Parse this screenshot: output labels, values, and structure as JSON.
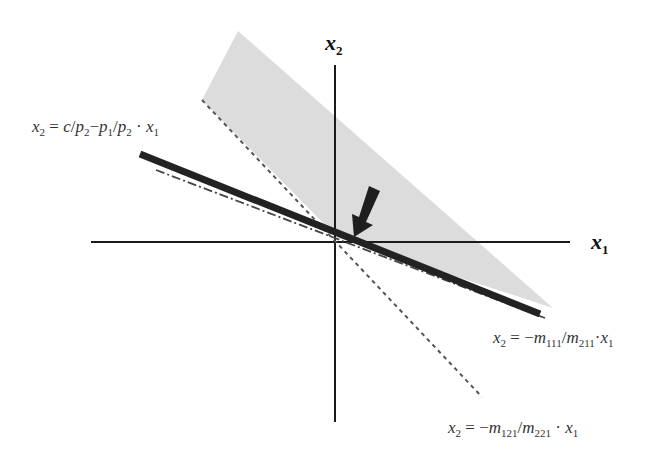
{
  "diagram": {
    "axes": {
      "x_label": {
        "var": "x",
        "sub": "1"
      },
      "y_label": {
        "var": "x",
        "sub": "2"
      }
    },
    "labels": {
      "budget_line": {
        "lhs_var": "x",
        "lhs_sub": "2",
        "eq": " = ",
        "c": "c",
        "slash1": "/",
        "p2a_var": "p",
        "p2a_sub": "2",
        "minus": "−",
        "p1_var": "p",
        "p1_sub": "1",
        "slash2": "/",
        "p2b_var": "p",
        "p2b_sub": "2",
        "dot": " · ",
        "x1_var": "x",
        "x1_sub": "1"
      },
      "line_111": {
        "lhs_var": "x",
        "lhs_sub": "2",
        "eq": " = −",
        "m_num_var": "m",
        "m_num_sub": "111",
        "slash": "/",
        "m_den_var": "m",
        "m_den_sub": "211",
        "dot": "·",
        "x1_var": "x",
        "x1_sub": "1"
      },
      "line_121": {
        "lhs_var": "x",
        "lhs_sub": "2",
        "eq": " = −",
        "m_num_var": "m",
        "m_num_sub": "121",
        "slash": "/",
        "m_den_var": "m",
        "m_den_sub": "221",
        "dot": " · ",
        "x1_var": "x",
        "x1_sub": "1"
      }
    },
    "colors": {
      "shade": "#dcdcdc",
      "axis": "#1a1a1a",
      "budget_line": "#222222",
      "dashed": "#555555",
      "dashdot": "#444444",
      "arrow": "#1e1e1e"
    },
    "marker": "arrow-pointing-to-origin"
  }
}
